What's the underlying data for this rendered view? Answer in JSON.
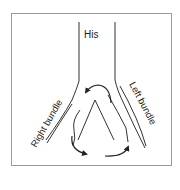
{
  "diagram": {
    "labels": {
      "his": "His",
      "right_bundle": "Right bundle",
      "left_bundle": "Left bundle"
    },
    "colors": {
      "line": "#333333",
      "frame": "#999999",
      "background": "#ffffff"
    }
  }
}
